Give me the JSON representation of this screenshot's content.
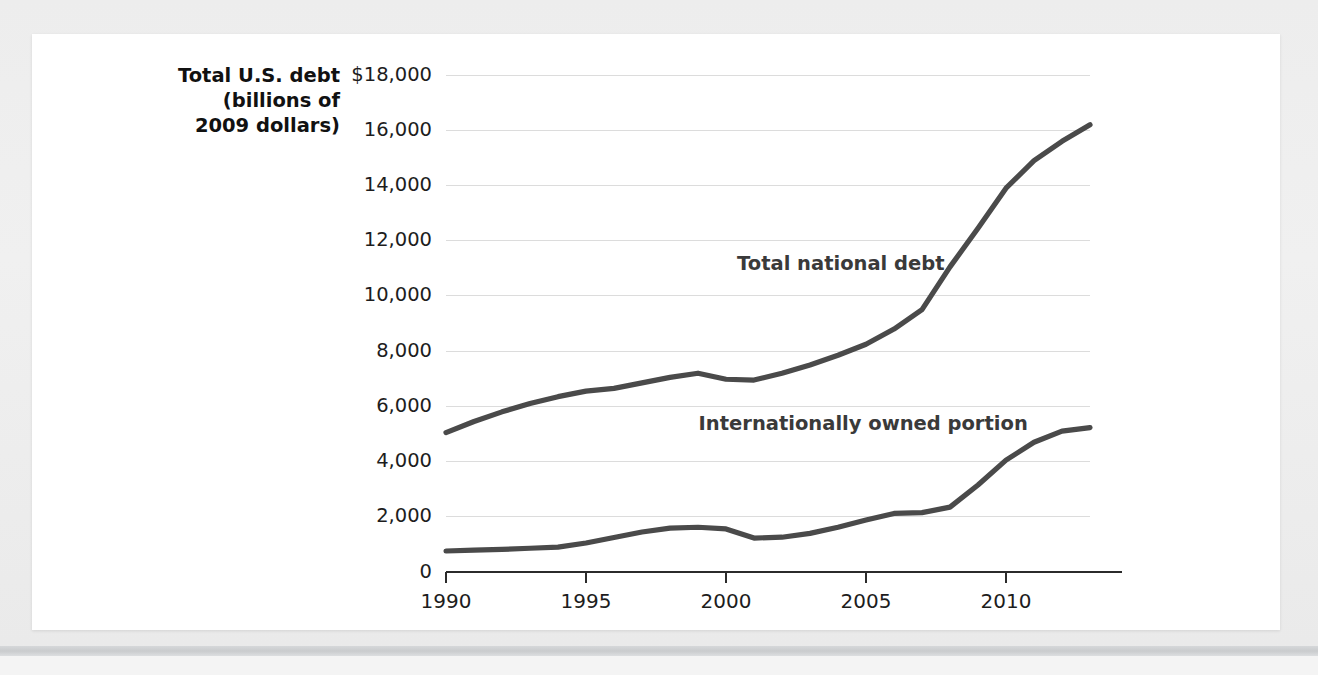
{
  "figure": {
    "background_color": "#ffffff",
    "page_background_color": "#eeeeee"
  },
  "chart_data": {
    "type": "line",
    "title": "",
    "ylabel_lines": [
      "Total U.S. debt",
      "(billions of",
      "2009 dollars)"
    ],
    "xlabel": "",
    "xlim": [
      1990,
      2013
    ],
    "ylim": [
      0,
      18000
    ],
    "grid": true,
    "legend_position": "inline-annotation",
    "line_color": "#4a4a4a",
    "gridline_color": "#dcdcdc",
    "axis_color": "#2b2b2b",
    "y_ticks": [
      0,
      2000,
      4000,
      6000,
      8000,
      10000,
      12000,
      14000,
      16000,
      18000
    ],
    "y_tick_labels": [
      "0",
      "2,000",
      "4,000",
      "6,000",
      "8,000",
      "10,000",
      "12,000",
      "14,000",
      "16,000",
      "$18,000"
    ],
    "x_ticks": [
      1990,
      1995,
      2000,
      2005,
      2010
    ],
    "x_tick_labels": [
      "1990",
      "1995",
      "2000",
      "2005",
      "2010"
    ],
    "x": [
      1990,
      1991,
      1992,
      1993,
      1994,
      1995,
      1996,
      1997,
      1998,
      1999,
      2000,
      2001,
      2002,
      2003,
      2004,
      2005,
      2006,
      2007,
      2008,
      2009,
      2010,
      2011,
      2012,
      2013
    ],
    "series": [
      {
        "name": "Total national debt",
        "annotation": "Total national debt",
        "annotation_x": 2004.1,
        "annotation_y": 10950,
        "values": [
          5050,
          5450,
          5800,
          6100,
          6350,
          6550,
          6650,
          6850,
          7050,
          7200,
          6980,
          6950,
          7200,
          7500,
          7850,
          8250,
          8800,
          9500,
          11050,
          12450,
          13900,
          14900,
          15600,
          16200
        ]
      },
      {
        "name": "Internationally owned portion",
        "annotation": "Internationally owned portion",
        "annotation_x": 2004.9,
        "annotation_y": 5150,
        "values": [
          760,
          790,
          820,
          860,
          900,
          1050,
          1250,
          1450,
          1590,
          1620,
          1560,
          1230,
          1260,
          1400,
          1620,
          1880,
          2120,
          2150,
          2350,
          3150,
          4050,
          4700,
          5100,
          5230
        ]
      }
    ]
  }
}
